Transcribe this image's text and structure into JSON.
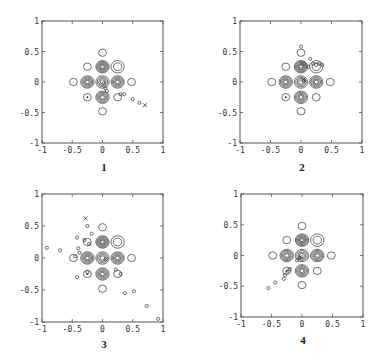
{
  "figure": {
    "panels": [
      {
        "id": "1",
        "caption": "1",
        "box": {
          "x": 42,
          "y": 21,
          "w": 121,
          "h": 122
        }
      },
      {
        "id": "2",
        "caption": "2",
        "box": {
          "x": 240,
          "y": 21,
          "w": 122,
          "h": 122
        }
      },
      {
        "id": "3",
        "caption": "3",
        "box": {
          "x": 42,
          "y": 194,
          "w": 121,
          "h": 128
        }
      },
      {
        "id": "4",
        "caption": "4",
        "box": {
          "x": 241,
          "y": 194,
          "w": 122,
          "h": 123
        }
      }
    ],
    "axis": {
      "xticks": [
        -1,
        -0.5,
        0,
        0.5,
        1
      ],
      "yticks": [
        -1,
        -0.5,
        0,
        0.5,
        1
      ],
      "xtick_labels": [
        "-1",
        "-0.5",
        "0",
        "0.5",
        "1"
      ],
      "ytick_labels": [
        "-1",
        "-0.5",
        "0",
        "0.5",
        "1"
      ],
      "xlim": [
        -1,
        1
      ],
      "ylim": [
        -1,
        1
      ]
    },
    "colors": {
      "line": "#333333",
      "box": "#555555"
    }
  },
  "chart_data": [
    {
      "type": "scatter",
      "title": "1",
      "xlabel": "",
      "ylabel": "",
      "xlim": [
        -1,
        1
      ],
      "ylim": [
        -1,
        1
      ],
      "grid": false,
      "contour_centers": [
        {
          "x": 0,
          "y": 0.25,
          "rings": 6
        },
        {
          "x": -0.25,
          "y": 0,
          "rings": 5
        },
        {
          "x": 0.25,
          "y": 0,
          "rings": 5
        },
        {
          "x": 0,
          "y": -0.25,
          "rings": 5
        },
        {
          "x": 0,
          "y": 0,
          "rings": 4
        },
        {
          "x": -0.25,
          "y": 0.25,
          "rings": 1
        },
        {
          "x": 0.25,
          "y": 0.25,
          "rings": 2
        },
        {
          "x": -0.25,
          "y": -0.25,
          "rings": 1
        },
        {
          "x": 0.25,
          "y": -0.25,
          "rings": 1
        },
        {
          "x": 0,
          "y": 0.48,
          "rings": 1
        },
        {
          "x": -0.48,
          "y": 0,
          "rings": 1
        },
        {
          "x": 0.48,
          "y": 0,
          "rings": 1
        },
        {
          "x": 0,
          "y": -0.48,
          "rings": 1
        }
      ],
      "trajectory": [
        {
          "x": 0.02,
          "y": -0.02
        },
        {
          "x": 0.05,
          "y": -0.1
        },
        {
          "x": 0.07,
          "y": -0.15
        },
        {
          "x": 0.3,
          "y": -0.2
        },
        {
          "x": 0.36,
          "y": -0.2
        },
        {
          "x": 0.5,
          "y": -0.28
        },
        {
          "x": 0.61,
          "y": -0.34
        }
      ],
      "end_marker": {
        "x": 0.7,
        "y": -0.38
      }
    },
    {
      "type": "scatter",
      "title": "2",
      "xlabel": "",
      "ylabel": "",
      "xlim": [
        -1,
        1
      ],
      "ylim": [
        -1,
        1
      ],
      "grid": false,
      "contour_centers": [
        {
          "x": 0,
          "y": 0.25,
          "rings": 6
        },
        {
          "x": -0.25,
          "y": 0,
          "rings": 5
        },
        {
          "x": 0.25,
          "y": 0,
          "rings": 5
        },
        {
          "x": 0,
          "y": -0.25,
          "rings": 5
        },
        {
          "x": 0,
          "y": 0,
          "rings": 4
        },
        {
          "x": -0.25,
          "y": 0.25,
          "rings": 1
        },
        {
          "x": 0.25,
          "y": 0.25,
          "rings": 2
        },
        {
          "x": -0.25,
          "y": -0.25,
          "rings": 1
        },
        {
          "x": 0.25,
          "y": -0.25,
          "rings": 1
        },
        {
          "x": 0,
          "y": 0.48,
          "rings": 1
        },
        {
          "x": -0.48,
          "y": 0,
          "rings": 1
        },
        {
          "x": 0.48,
          "y": 0,
          "rings": 1
        },
        {
          "x": 0,
          "y": -0.48,
          "rings": 1
        }
      ],
      "trajectory": [
        {
          "x": 0,
          "y": 0.58
        },
        {
          "x": 0.05,
          "y": 0.3
        },
        {
          "x": 0.12,
          "y": 0.25
        },
        {
          "x": 0.15,
          "y": 0.38
        },
        {
          "x": 0.2,
          "y": 0.3
        },
        {
          "x": 0.25,
          "y": 0.28
        },
        {
          "x": 0.3,
          "y": 0.3
        },
        {
          "x": 0.35,
          "y": 0.28
        },
        {
          "x": 0.05,
          "y": 0.02
        }
      ],
      "end_marker": {
        "x": 0.04,
        "y": 0.04
      }
    },
    {
      "type": "scatter",
      "title": "3",
      "xlabel": "",
      "ylabel": "",
      "xlim": [
        -1,
        1
      ],
      "ylim": [
        -1,
        1
      ],
      "grid": false,
      "contour_centers": [
        {
          "x": 0,
          "y": 0.25,
          "rings": 6
        },
        {
          "x": -0.25,
          "y": 0,
          "rings": 5
        },
        {
          "x": 0.25,
          "y": 0,
          "rings": 5
        },
        {
          "x": 0,
          "y": -0.25,
          "rings": 5
        },
        {
          "x": 0,
          "y": 0,
          "rings": 4
        },
        {
          "x": -0.25,
          "y": 0.25,
          "rings": 1
        },
        {
          "x": 0.25,
          "y": 0.25,
          "rings": 2
        },
        {
          "x": -0.25,
          "y": -0.25,
          "rings": 1
        },
        {
          "x": 0.25,
          "y": -0.25,
          "rings": 1
        },
        {
          "x": 0,
          "y": 0.48,
          "rings": 1
        },
        {
          "x": -0.48,
          "y": 0,
          "rings": 1
        },
        {
          "x": 0.48,
          "y": 0,
          "rings": 1
        },
        {
          "x": 0,
          "y": -0.48,
          "rings": 1
        }
      ],
      "trajectory": [
        {
          "x": -0.92,
          "y": 0.16
        },
        {
          "x": -0.7,
          "y": 0.12
        },
        {
          "x": -0.42,
          "y": 0.32
        },
        {
          "x": -0.4,
          "y": 0.15
        },
        {
          "x": -0.25,
          "y": 0.5
        },
        {
          "x": -0.18,
          "y": 0.38
        },
        {
          "x": -0.3,
          "y": 0.28
        },
        {
          "x": -0.22,
          "y": 0.22
        },
        {
          "x": -0.45,
          "y": 0.03
        },
        {
          "x": -0.38,
          "y": 0.08
        },
        {
          "x": -0.25,
          "y": -0.22
        },
        {
          "x": -0.42,
          "y": -0.3
        },
        {
          "x": 0.05,
          "y": -0.02
        },
        {
          "x": 0.22,
          "y": -0.18
        },
        {
          "x": 0.3,
          "y": -0.25
        },
        {
          "x": 0.37,
          "y": -0.55
        },
        {
          "x": 0.52,
          "y": -0.52
        },
        {
          "x": 0.73,
          "y": -0.75
        },
        {
          "x": 0.92,
          "y": -0.95
        }
      ],
      "end_marker": {
        "x": -0.28,
        "y": 0.62
      }
    },
    {
      "type": "scatter",
      "title": "4",
      "xlabel": "",
      "ylabel": "",
      "xlim": [
        -1,
        1
      ],
      "ylim": [
        -1,
        1
      ],
      "grid": false,
      "contour_centers": [
        {
          "x": 0,
          "y": 0.25,
          "rings": 6
        },
        {
          "x": -0.25,
          "y": 0,
          "rings": 5
        },
        {
          "x": 0.25,
          "y": 0,
          "rings": 5
        },
        {
          "x": 0,
          "y": -0.25,
          "rings": 5
        },
        {
          "x": 0,
          "y": 0,
          "rings": 4
        },
        {
          "x": -0.25,
          "y": 0.25,
          "rings": 1
        },
        {
          "x": 0.25,
          "y": 0.25,
          "rings": 2
        },
        {
          "x": -0.25,
          "y": -0.25,
          "rings": 1
        },
        {
          "x": 0.25,
          "y": -0.25,
          "rings": 1
        },
        {
          "x": 0,
          "y": 0.48,
          "rings": 1
        },
        {
          "x": -0.48,
          "y": 0,
          "rings": 1
        },
        {
          "x": 0.48,
          "y": 0,
          "rings": 1
        },
        {
          "x": 0,
          "y": -0.48,
          "rings": 1
        }
      ],
      "trajectory": [
        {
          "x": -0.55,
          "y": -0.53
        },
        {
          "x": -0.44,
          "y": -0.44
        },
        {
          "x": -0.3,
          "y": -0.38
        },
        {
          "x": -0.28,
          "y": -0.32
        },
        {
          "x": -0.24,
          "y": -0.26
        },
        {
          "x": -0.2,
          "y": -0.22
        },
        {
          "x": -0.08,
          "y": -0.08
        },
        {
          "x": -0.04,
          "y": -0.04
        }
      ],
      "end_marker": {
        "x": -0.02,
        "y": -0.02
      }
    }
  ]
}
